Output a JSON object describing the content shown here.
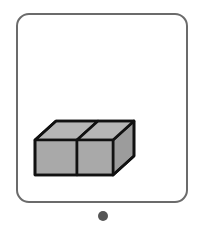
{
  "canvas": {
    "width": 204,
    "height": 231,
    "background_color": "#ffffff"
  },
  "card": {
    "name": "answer-choice-card",
    "border_color": "#6b6b6b",
    "border_width": 2,
    "corner_radius": 13,
    "fill_color": "#ffffff",
    "x": 16,
    "y": 13,
    "width": 172,
    "height": 190
  },
  "bullet": {
    "label": "",
    "color": "#555555",
    "diameter": 10,
    "center_x": 103,
    "center_y": 216
  },
  "figure": {
    "name": "two-unit-cubes",
    "description": "Two unit cubes joined side by side, drawn in oblique projection",
    "cube_count": 2,
    "visible_faces": [
      "front-left",
      "front-right",
      "top-left",
      "top-right",
      "right-side"
    ],
    "colors": {
      "front_face": "#a9a9a9",
      "top_face": "#b6b6b6",
      "side_face": "#9c9c9c",
      "outline": "#111111"
    },
    "outline_width": 2.6,
    "geometry": {
      "front_bottom_left": [
        35,
        175
      ],
      "front_bottom_mid": [
        77,
        175
      ],
      "front_bottom_right": [
        113,
        175
      ],
      "front_top_left": [
        35,
        140
      ],
      "front_top_mid": [
        77,
        140
      ],
      "front_top_right": [
        113,
        140
      ],
      "back_top_left": [
        56,
        121
      ],
      "back_top_mid": [
        98,
        121
      ],
      "back_top_right": [
        134,
        121
      ],
      "back_bottom_right": [
        134,
        156
      ]
    }
  }
}
